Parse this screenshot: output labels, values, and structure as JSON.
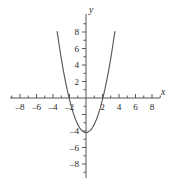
{
  "chart_data": {
    "type": "line",
    "title": "",
    "subtitle": "",
    "xlabel": "x",
    "ylabel": "y",
    "xlim": [
      -9.2,
      9.2
    ],
    "ylim": [
      -9.2,
      9.2
    ],
    "grid": false,
    "legend": false,
    "legend_position": "none",
    "axis_style": "cartesian-cross",
    "x_ticks_major": [
      -8,
      -6,
      -4,
      -2,
      2,
      4,
      6,
      8
    ],
    "x_tick_labels": [
      "-8",
      "-6",
      "-4",
      "-2",
      "2",
      "4",
      "6",
      "8"
    ],
    "y_ticks_major": [
      -8,
      -6,
      -4,
      2,
      4,
      6,
      8
    ],
    "y_tick_labels": [
      "-8",
      "-6",
      "-4",
      "2",
      "4",
      "6",
      "8"
    ],
    "x_minor_tick_step": 1,
    "y_minor_tick_step": 1,
    "series": [
      {
        "name": "parabola",
        "equation": "y = x^2 - 4.2",
        "vertex": [
          0,
          -4.2
        ],
        "x_intercepts": [
          -2.05,
          2.05
        ],
        "y_intercept": -4.2,
        "opens": "upward",
        "color": "#5a5a5a",
        "x": [
          -3.5,
          -3.25,
          -3.0,
          -2.75,
          -2.5,
          -2.25,
          -2.0,
          -1.75,
          -1.5,
          -1.25,
          -1.0,
          -0.75,
          -0.5,
          -0.25,
          0,
          0.25,
          0.5,
          0.75,
          1.0,
          1.25,
          1.5,
          1.75,
          2.0,
          2.25,
          2.5,
          2.75,
          3.0,
          3.25,
          3.5
        ],
        "y": [
          8.05,
          6.36,
          4.8,
          3.36,
          2.05,
          0.86,
          -0.2,
          -1.14,
          -1.95,
          -2.64,
          -3.2,
          -3.64,
          -3.95,
          -4.14,
          -4.2,
          -4.14,
          -3.95,
          -3.64,
          -3.2,
          -2.64,
          -1.95,
          -1.14,
          -0.2,
          0.86,
          2.05,
          3.36,
          4.8,
          6.36,
          8.05
        ]
      }
    ],
    "annotations": []
  },
  "axes": {
    "x_axis_label": "x",
    "y_axis_label": "y"
  }
}
